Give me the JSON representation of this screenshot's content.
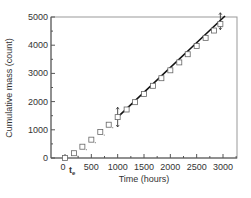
{
  "chart_data": {
    "type": "scatter",
    "title": "",
    "xlabel": "Time (hours)",
    "ylabel": "Cumulative mass (count)",
    "xlim": [
      -250,
      3250
    ],
    "ylim": [
      0,
      5000
    ],
    "x_ticks": [
      0,
      500,
      1000,
      1500,
      2000,
      2500,
      3000
    ],
    "x_tick_labels": [
      "0",
      "500",
      "1000",
      "1500",
      "2000",
      "2500",
      "3000"
    ],
    "y_ticks": [
      0,
      1000,
      2000,
      3000,
      4000,
      5000
    ],
    "y_tick_labels": [
      "0",
      "1000",
      "2000",
      "3000",
      "4000",
      "5000"
    ],
    "annotation": {
      "text": "t",
      "subscript": "e",
      "x": 150
    },
    "grid": false,
    "series": [
      {
        "name": "measured",
        "marker": "open-square",
        "x": [
          0,
          170,
          330,
          500,
          670,
          830,
          1000,
          1170,
          1330,
          1500,
          1670,
          1830,
          2000,
          2170,
          2330,
          2500,
          2670,
          2830,
          2950
        ],
        "values": [
          0,
          170,
          400,
          650,
          920,
          1180,
          1450,
          1720,
          1980,
          2270,
          2560,
          2830,
          3110,
          3390,
          3680,
          3970,
          4260,
          4520,
          4750
        ]
      },
      {
        "name": "linear fit",
        "marker": "none",
        "line": "solid",
        "x": [
          1000,
          3000
        ],
        "values": [
          1450,
          5000
        ]
      }
    ],
    "error_bars": [
      {
        "x": 1000,
        "y": 1450,
        "low": 1100,
        "high": 1800
      },
      {
        "x": 2950,
        "y": 4850,
        "low": 4550,
        "high": 5150
      }
    ]
  }
}
